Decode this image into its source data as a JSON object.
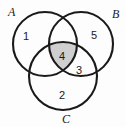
{
  "figure": {
    "type": "venn-diagram-3-set",
    "background_color": "#fdfdfd",
    "stroke_color": "#1a1a1a",
    "stroke_width": 2.1,
    "shaded_fill_color": "#cfcfcf",
    "unshaded_fill_color": "#ffffff",
    "text_color": "#1a1a1a"
  },
  "sets": [
    {
      "id": "A",
      "label": "A",
      "label_x": 8,
      "label_y": 16,
      "cx": 45,
      "cy": 44,
      "r": 32
    },
    {
      "id": "B",
      "label": "B",
      "label_x": 112,
      "label_y": 18,
      "cx": 81,
      "cy": 44,
      "r": 32
    },
    {
      "id": "C",
      "label": "C",
      "label_x": 62,
      "label_y": 123,
      "cx": 63,
      "cy": 76,
      "r": 34
    }
  ],
  "regions": [
    {
      "id": "A-only",
      "label": "1",
      "x": 26,
      "y": 37,
      "shaded": false,
      "description": "A only"
    },
    {
      "id": "B-only",
      "label": "5",
      "x": 94,
      "y": 36,
      "shaded": false,
      "description": "B only"
    },
    {
      "id": "C-only",
      "label": "2",
      "x": 62,
      "y": 96,
      "shaded": false,
      "description": "C only"
    },
    {
      "id": "B-and-C",
      "label": "3",
      "x": 79,
      "y": 71,
      "shaded": false,
      "description": "B intersect C"
    },
    {
      "id": "A-and-B-and-C",
      "label": "4",
      "x": 62,
      "y": 57,
      "shaded": true,
      "description": "A intersect B intersect C"
    }
  ]
}
